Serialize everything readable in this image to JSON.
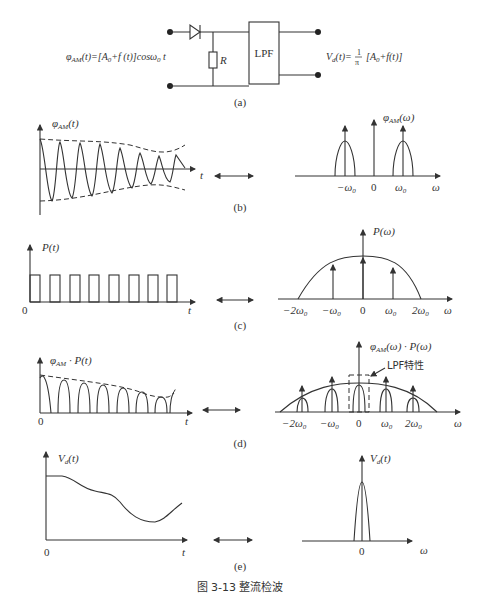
{
  "figure": {
    "caption": "图 3-13   整流检波",
    "panels": {
      "a": {
        "label": "(a)",
        "input_label": "φ_AM(t)=[A_0+f(t)]cosω_0 t",
        "resistor_label": "R",
        "filter_label": "LPF",
        "output_label": "V_d(t)= 1/π [A_0+f(t)]",
        "output_frac_num": "1",
        "output_frac_den": "π"
      },
      "b": {
        "label": "(b)",
        "time_ylabel": "φ_AM(t)",
        "time_xlabel": "t",
        "freq_ylabel": "φ_AM(ω)",
        "freq_xlabel": "ω",
        "freq_ticks": [
          "-ω_0",
          "0",
          "ω_0"
        ]
      },
      "c": {
        "label": "(c)",
        "time_ylabel": "P(t)",
        "time_xlabel": "t",
        "time_origin": "0",
        "freq_ylabel": "P(ω)",
        "freq_xlabel": "ω",
        "freq_ticks": [
          "-2ω_0",
          "-ω_0",
          "0",
          "ω_0",
          "2ω_0"
        ]
      },
      "d": {
        "label": "(d)",
        "time_ylabel": "φ_AM · P(t)",
        "time_xlabel": "t",
        "time_origin": "0",
        "freq_ylabel": "φ_AM(ω) · P(ω)",
        "freq_xlabel": "ω",
        "freq_ticks": [
          "-2ω_0",
          "-ω_0",
          "0",
          "ω_0",
          "2ω_0"
        ],
        "annotation": "LPF特性"
      },
      "e": {
        "label": "(e)",
        "time_ylabel": "V_d(t)",
        "time_xlabel": "t",
        "time_origin": "0",
        "freq_ylabel": "V_d(t)",
        "freq_xlabel": "ω",
        "freq_ticks": [
          "0"
        ]
      }
    }
  }
}
